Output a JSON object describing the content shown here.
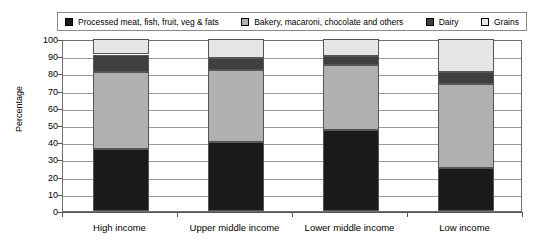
{
  "chart_data": {
    "type": "bar",
    "subtype": "stacked-100-percent",
    "title": "",
    "xlabel": "",
    "ylabel": "Percentage",
    "ylim": [
      0,
      100
    ],
    "yticks": [
      0,
      10,
      20,
      30,
      40,
      50,
      60,
      70,
      80,
      90,
      100
    ],
    "grid": true,
    "legend_position": "top",
    "categories": [
      "High income",
      "Upper middle income",
      "Lower middle income",
      "Low income"
    ],
    "series": [
      {
        "name": "Processed meat, fish, fruit, veg & fats",
        "color": "#1a1a1a",
        "values": [
          36,
          40,
          47,
          25
        ]
      },
      {
        "name": "Bakery, macaroni, chocolate and others",
        "color": "#b0b0b0",
        "values": [
          45,
          42,
          38,
          49
        ]
      },
      {
        "name": "Dairy",
        "color": "#3f3f3f",
        "values": [
          10,
          7,
          5,
          7
        ]
      },
      {
        "name": "Grains",
        "color": "#e6e6e6",
        "values": [
          9,
          11,
          10,
          19
        ]
      }
    ]
  },
  "legend": {
    "items": [
      {
        "label": "Processed meat, fish, fruit, veg & fats",
        "color": "#1a1a1a"
      },
      {
        "label": "Bakery, macaroni, chocolate and others",
        "color": "#b0b0b0"
      },
      {
        "label": "Dairy",
        "color": "#3f3f3f"
      },
      {
        "label": "Grains",
        "color": "#e6e6e6"
      }
    ]
  },
  "axes": {
    "y_title": "Percentage",
    "y_labels": [
      "100",
      "90",
      "80",
      "70",
      "60",
      "50",
      "40",
      "30",
      "20",
      "10",
      "0"
    ],
    "x_labels": [
      "High income",
      "Upper middle income",
      "Lower middle income",
      "Low income"
    ]
  }
}
